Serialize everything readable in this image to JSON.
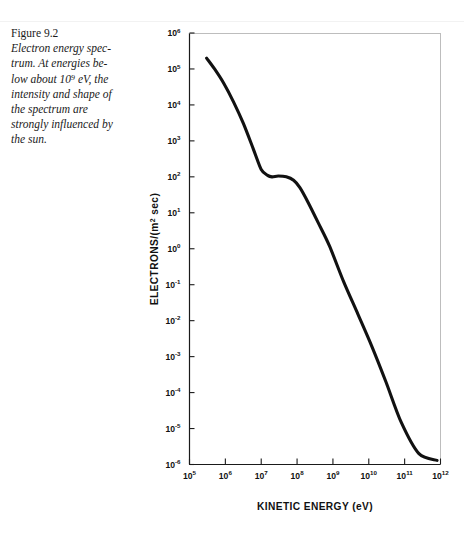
{
  "caption": {
    "figure_number": "Figure 9.2",
    "text_lines": [
      "Electron energy spec-",
      "trum. At energies be-",
      "low about 10⁹ eV, the",
      "intensity and shape of",
      "the spectrum are",
      "strongly influenced by",
      "the sun."
    ],
    "full_text": "Electron energy spectrum. At energies below about 10⁹ eV, the intensity and shape of the spectrum are strongly influenced by the sun."
  },
  "colors": {
    "curve": "#111111",
    "axis": "#1a1a1a",
    "background": "#ffffff"
  },
  "chart_data": {
    "type": "line",
    "title": "",
    "xlabel": "KINETIC ENERGY (eV)",
    "ylabel": "ELECTRONS/(m² sec)",
    "xscale": "log",
    "yscale": "log",
    "xlim": [
      100000,
      1000000000000
    ],
    "ylim": [
      1e-06,
      1000000
    ],
    "grid": false,
    "legend": "none",
    "xticklabels": [
      "10⁵",
      "10⁶",
      "10⁷",
      "10⁸",
      "10⁹",
      "10¹⁰",
      "10¹¹",
      "10¹²"
    ],
    "xtick_exponents": [
      5,
      6,
      7,
      8,
      9,
      10,
      11,
      12
    ],
    "yticklabels": [
      "10⁶",
      "10⁵",
      "10⁴",
      "10³",
      "10²",
      "10¹",
      "10⁰",
      "10⁻¹",
      "10⁻²",
      "10⁻³",
      "10⁻⁴",
      "10⁻⁵",
      "10⁻⁶"
    ],
    "ytick_exponents": [
      6,
      5,
      4,
      3,
      2,
      1,
      0,
      -1,
      -2,
      -3,
      -4,
      -5,
      -6
    ],
    "series": [
      {
        "name": "Electron energy spectrum",
        "x": [
          300000.0,
          500000.0,
          900000.0,
          1700000.0,
          3200000.0,
          6000000.0,
          10000000.0,
          15000000.0,
          20000000.0,
          30000000.0,
          50000000.0,
          80000000.0,
          120000000.0,
          200000000.0,
          400000000.0,
          800000000.0,
          2000000000.0,
          5000000000.0,
          12000000000.0,
          30000000000.0,
          80000000000.0,
          250000000000.0,
          800000000000.0
        ],
        "y": [
          200000.0,
          100000.0,
          40000.0,
          12000.0,
          3000.0,
          600.0,
          160.0,
          110.0,
          100.0,
          105.0,
          100.0,
          80.0,
          50.0,
          20.0,
          5.0,
          1.2,
          0.12,
          0.015,
          0.002,
          0.0002,
          1.5e-05,
          2e-06,
          1.3e-06
        ]
      }
    ],
    "annotations": [
      "Steep solar-modulated falloff below ~10⁷ eV",
      "Shoulder / plateau near 10² electrons/(m² sec) between ~2×10⁷ and 10⁸ eV",
      "Power-law decline from ~10⁸ eV to 10¹² eV"
    ]
  }
}
